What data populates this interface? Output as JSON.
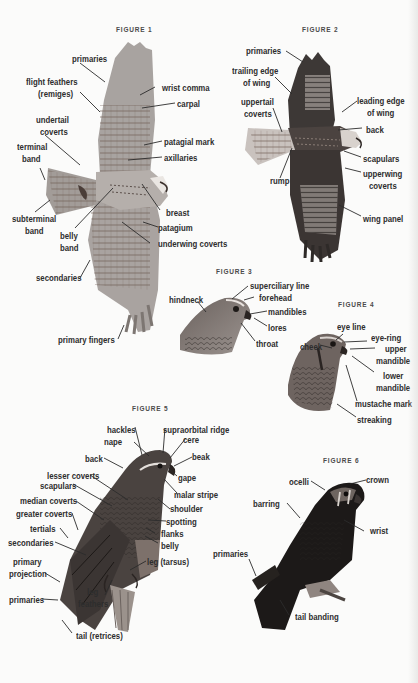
{
  "figures": [
    {
      "title": "FIGURE 1",
      "subject": "soaring hawk, underside",
      "labels": [
        "primaries",
        "flight feathers",
        "(remiges)",
        "wrist comma",
        "carpal",
        "undertail",
        "coverts",
        "terminal",
        "band",
        "patagial mark",
        "axillaries",
        "breast",
        "subterminal",
        "band",
        "belly",
        "band",
        "patagium",
        "underwing coverts",
        "secondaries",
        "primary fingers"
      ]
    },
    {
      "title": "FIGURE 2",
      "subject": "flying hawk, upperside",
      "labels": [
        "primaries",
        "trailing edge",
        "of wing",
        "leading edge",
        "of wing",
        "uppertail",
        "coverts",
        "back",
        "scapulars",
        "rump",
        "upperwing",
        "coverts",
        "wing panel"
      ]
    },
    {
      "title": "FIGURE 3",
      "subject": "hawk head",
      "labels": [
        "superciliary line",
        "forehead",
        "hindneck",
        "mandibles",
        "lores",
        "throat"
      ]
    },
    {
      "title": "FIGURE 4",
      "subject": "falcon head",
      "labels": [
        "eye line",
        "eye-ring",
        "cheek",
        "upper",
        "mandible",
        "lower",
        "mandible",
        "mustache mark",
        "streaking"
      ]
    },
    {
      "title": "FIGURE 5",
      "subject": "perched buteo",
      "labels": [
        "hackles",
        "supraorbital ridge",
        "nape",
        "cere",
        "beak",
        "back",
        "lesser coverts",
        "gape",
        "scapulars",
        "malar stripe",
        "median coverts",
        "shoulder",
        "greater coverts",
        "spotting",
        "tertials",
        "flanks",
        "secondaries",
        "belly",
        "primary",
        "projection",
        "leg (tarsus)",
        "leg",
        "feathers",
        "primaries",
        "tail (retrices)"
      ]
    },
    {
      "title": "FIGURE 6",
      "subject": "perched falcon",
      "labels": [
        "ocelli",
        "crown",
        "barring",
        "wrist",
        "primaries",
        "tail banding"
      ]
    }
  ]
}
